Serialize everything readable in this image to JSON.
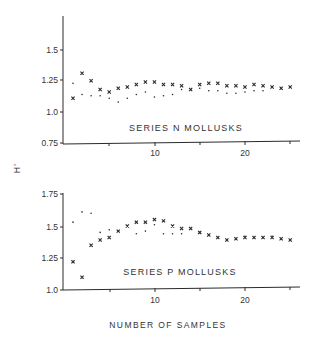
{
  "chart_data": [
    {
      "type": "scatter",
      "title": "SERIES N MOLLUSKS",
      "xlabel": "",
      "ylabel": "H'",
      "xlim": [
        0,
        25
      ],
      "ylim": [
        0.75,
        1.75
      ],
      "yticks": [
        "1.5",
        "1.25",
        "1.0",
        "0.75"
      ],
      "yticks_values": [
        1.5,
        1.25,
        1.0,
        0.75
      ],
      "xticks": [
        "10",
        "20"
      ],
      "xticks_minor": [
        5,
        10,
        15,
        20,
        25
      ],
      "grid": false,
      "legend": "none",
      "series": [
        {
          "name": "x-markers",
          "marker": "x",
          "x": [
            1,
            2,
            3,
            4,
            5,
            6,
            7,
            8,
            9,
            10,
            11,
            12,
            13,
            14,
            15,
            16,
            17,
            18,
            19,
            20,
            21,
            22,
            23,
            24,
            25
          ],
          "values": [
            1.11,
            1.31,
            1.25,
            1.18,
            1.16,
            1.19,
            1.2,
            1.22,
            1.24,
            1.24,
            1.22,
            1.22,
            1.21,
            1.18,
            1.22,
            1.23,
            1.23,
            1.21,
            1.21,
            1.2,
            1.22,
            1.21,
            1.2,
            1.19,
            1.2
          ]
        },
        {
          "name": "dots",
          "marker": "dot",
          "x": [
            1,
            2,
            3,
            4,
            5,
            6,
            7,
            8,
            9,
            10,
            11,
            12,
            13,
            14,
            15,
            16,
            17,
            18,
            19,
            20,
            21,
            22,
            23,
            24,
            25
          ],
          "values": [
            1.23,
            1.14,
            1.13,
            1.13,
            1.11,
            1.08,
            1.11,
            1.14,
            1.16,
            1.12,
            1.13,
            1.14,
            1.18,
            1.18,
            1.19,
            1.17,
            1.17,
            1.15,
            1.15,
            1.16,
            1.17,
            1.17,
            1.2,
            1.19,
            1.2
          ]
        }
      ]
    },
    {
      "type": "scatter",
      "title": "SERIES P MOLLUSKS",
      "xlabel": "NUMBER OF SAMPLES",
      "ylabel": "H'",
      "xlim": [
        0,
        25
      ],
      "ylim": [
        1.0,
        1.75
      ],
      "yticks": [
        "1.75",
        "1.5",
        "1.25",
        "1.0"
      ],
      "yticks_values": [
        1.75,
        1.5,
        1.25,
        1.0
      ],
      "xticks": [
        "10",
        "20"
      ],
      "xticks_minor": [
        5,
        10,
        15,
        20,
        25
      ],
      "grid": false,
      "legend": "none",
      "series": [
        {
          "name": "x-markers",
          "marker": "x",
          "x": [
            1,
            2,
            3,
            4,
            5,
            6,
            7,
            8,
            9,
            10,
            11,
            12,
            13,
            14,
            15,
            16,
            17,
            18,
            19,
            20,
            21,
            22,
            23,
            24,
            25
          ],
          "values": [
            1.22,
            1.1,
            1.35,
            1.39,
            1.41,
            1.46,
            1.5,
            1.53,
            1.53,
            1.55,
            1.54,
            1.5,
            1.48,
            1.48,
            1.45,
            1.43,
            1.41,
            1.39,
            1.4,
            1.41,
            1.41,
            1.41,
            1.41,
            1.4,
            1.39
          ]
        },
        {
          "name": "dots",
          "marker": "dot",
          "x": [
            1,
            2,
            3,
            4,
            5,
            6,
            7,
            8,
            9,
            10,
            11,
            12,
            13,
            14,
            15,
            16,
            17,
            18,
            19,
            20,
            21,
            22,
            23,
            24,
            25
          ],
          "values": [
            1.53,
            1.61,
            1.6,
            1.45,
            1.47,
            1.46,
            1.5,
            1.44,
            1.46,
            1.51,
            1.44,
            1.44,
            1.44,
            1.48,
            1.45,
            1.43,
            1.41,
            1.39,
            1.4,
            1.42,
            1.41,
            1.41,
            1.42,
            1.4,
            1.39
          ]
        }
      ]
    }
  ],
  "labels": {
    "ylabel": "H'",
    "top_series": "SERIES N MOLLUSKS",
    "bottom_series": "SERIES P MOLLUSKS",
    "xlabel": "NUMBER OF SAMPLES",
    "top_yticks": [
      "1.5",
      "1.25",
      "1.0",
      "0.75"
    ],
    "bottom_yticks": [
      "1.75",
      "1.5",
      "1.25",
      "1.0"
    ],
    "xtick_10": "10",
    "xtick_20": "20"
  },
  "colors": {
    "ink": "#2a2a2a",
    "background": "#ffffff"
  }
}
